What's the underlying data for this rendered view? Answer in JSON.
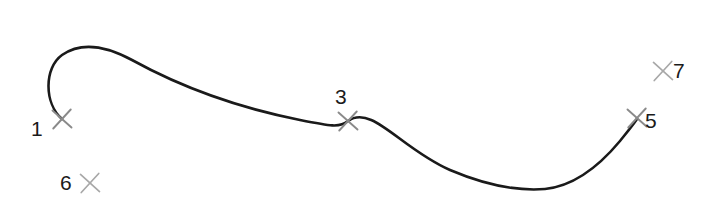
{
  "figure": {
    "background_color": "#ffffff",
    "width": 716,
    "height": 207
  },
  "curve": {
    "name": "spline-curve",
    "stroke_color": "#1a1a1a",
    "stroke_width": 2.6,
    "description": "Open S-shaped spline: starts at point 1, hooks up and left, crests near x=115, descends through point 3, dips to a trough near x=540, then rises to end at point 5",
    "path": "M 62 119 C 44 103 44 68 62 55 C 82 41 108 47 132 60 C 190 92 250 110 300 120 C 330 126 340 128 348 121 C 372 104 400 148 450 170 C 490 187 520 191 545 189 C 575 186 600 165 620 141 C 628 131 633 125 637 119",
    "extreme_points": {
      "start": [
        62,
        119
      ],
      "leftmost": [
        50,
        75
      ],
      "crest": [
        115,
        52
      ],
      "midpoint": [
        348,
        121
      ],
      "trough": [
        540,
        189
      ],
      "end": [
        637,
        119
      ]
    }
  },
  "points": [
    {
      "id": "1",
      "label": "1",
      "marker": "x-marker",
      "marker_color": "#8a8a8a",
      "marker_x": 62,
      "marker_y": 119,
      "marker_size": 19,
      "on_curve": true,
      "label_x": 31,
      "label_y": 118,
      "label_position": "left"
    },
    {
      "id": "3",
      "label": "3",
      "marker": "x-marker",
      "marker_color": "#8a8a8a",
      "marker_x": 348,
      "marker_y": 121,
      "marker_size": 19,
      "on_curve": true,
      "label_x": 335,
      "label_y": 86,
      "label_position": "above"
    },
    {
      "id": "5",
      "label": "5",
      "marker": "x-marker",
      "marker_color": "#8a8a8a",
      "marker_x": 637,
      "marker_y": 118,
      "marker_size": 19,
      "on_curve": true,
      "label_x": 645,
      "label_y": 110,
      "label_position": "right"
    },
    {
      "id": "6",
      "label": "6",
      "marker": "x-marker",
      "marker_color": "#a8a8a8",
      "marker_x": 90,
      "marker_y": 183,
      "marker_size": 19,
      "on_curve": false,
      "label_x": 60,
      "label_y": 172,
      "label_position": "left"
    },
    {
      "id": "7",
      "label": "7",
      "marker": "x-marker",
      "marker_color": "#a8a8a8",
      "marker_x": 663,
      "marker_y": 71,
      "marker_size": 19,
      "on_curve": false,
      "label_x": 673,
      "label_y": 60,
      "label_position": "right"
    }
  ],
  "marker_glyph": "✕"
}
